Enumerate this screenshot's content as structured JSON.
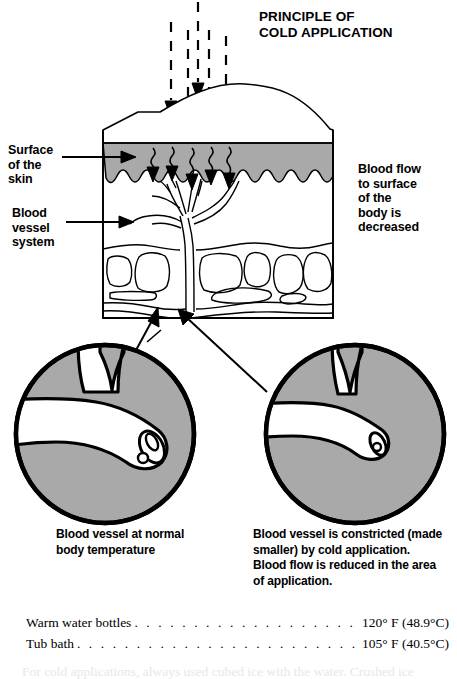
{
  "title": {
    "line1": "PRINCIPLE OF",
    "line2": "COLD APPLICATION"
  },
  "labels": {
    "surface_of_skin": "Surface\nof the\nskin",
    "blood_vessel_system": "Blood\nvessel\nsystem",
    "blood_flow_decreased": "Blood flow\nto surface\nof the\nbody is\ndecreased"
  },
  "captions": {
    "left": "Blood vessel at normal\nbody temperature",
    "right": "Blood vessel is constricted (made\nsmaller) by cold application.\nBlood flow is reduced in the area\nof application."
  },
  "temperature_list": {
    "dots": ". . . . . . . . . . . . . . . . . . . . . . . . . . . . . . . . . . . . . . . . . . . . . . . . . . . . . . . . .",
    "rows": [
      {
        "name": "Warm water bottles",
        "value": "120° F (48.9°C)"
      },
      {
        "name": "Tub bath",
        "value": "105° F (40.5°C)"
      }
    ]
  },
  "cut_off_paragraph": "For cold applications, always used cubed ice with the water. Crushed ice",
  "colors": {
    "skin_gray": "#a9a9a9",
    "ink": "#000000",
    "paper": "#ffffff"
  },
  "figure": {
    "arrows_cold_count": 5,
    "inset_left_name": "normal-blood-vessel-inset",
    "inset_right_name": "constricted-blood-vessel-inset"
  }
}
